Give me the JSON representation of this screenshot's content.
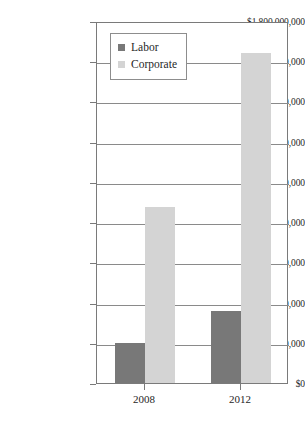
{
  "chart_data": {
    "type": "bar",
    "title": "",
    "xlabel": "",
    "ylabel": "",
    "categories": [
      "2008",
      "2012"
    ],
    "series": [
      {
        "name": "Labor",
        "color": "#787878",
        "values": [
          200000000,
          360000000
        ]
      },
      {
        "name": "Corporate",
        "color": "#d4d4d4",
        "values": [
          875000000,
          1640000000
        ]
      }
    ],
    "ylim": [
      0,
      1800000000
    ],
    "ytick_values": [
      0,
      200000000,
      400000000,
      600000000,
      800000000,
      1000000000,
      1200000000,
      1400000000,
      1600000000,
      1800000000
    ],
    "ytick_labels": [
      "$0",
      "$200,000,000",
      "$400,000,000",
      "$600,000,000",
      "$800,000,000",
      "$1,000,000,000",
      "$1,200,000,000",
      "$1,400,000,000",
      "$1,600,000,000",
      "$1,800,000,000"
    ],
    "grid": true,
    "legend_position": "top-left-inside",
    "legend_entries": [
      "Labor",
      "Corporate"
    ]
  },
  "legend": {
    "items": [
      {
        "label": "Labor",
        "swatch": "labor"
      },
      {
        "label": "Corporate",
        "swatch": "corporate"
      }
    ]
  },
  "axis": {
    "x_labels": [
      "2008",
      "2012"
    ]
  }
}
